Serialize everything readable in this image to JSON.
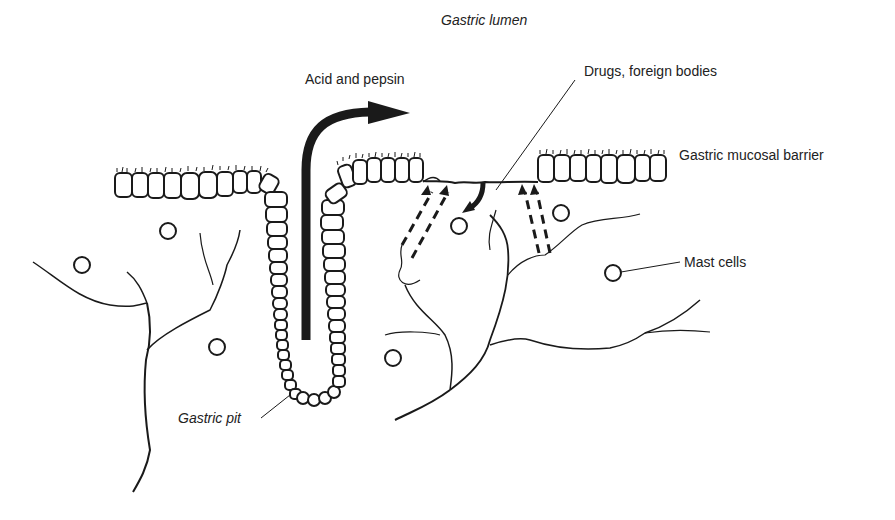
{
  "diagram": {
    "labels": {
      "lumen": "Gastric lumen",
      "acid": "Acid and pepsin",
      "drugs": "Drugs, foreign bodies",
      "barrier": "Gastric mucosal barrier",
      "mast": "Mast cells",
      "pit": "Gastric pit"
    },
    "colors": {
      "ink": "#1a1a1a",
      "background": "#ffffff"
    },
    "mast_cells": [
      {
        "cx": 168,
        "cy": 231
      },
      {
        "cx": 82,
        "cy": 265
      },
      {
        "cx": 217,
        "cy": 347
      },
      {
        "cx": 393,
        "cy": 358
      },
      {
        "cx": 459,
        "cy": 226
      },
      {
        "cx": 561,
        "cy": 213
      },
      {
        "cx": 613,
        "cy": 273
      }
    ]
  }
}
